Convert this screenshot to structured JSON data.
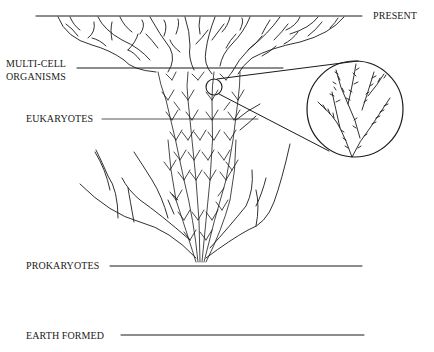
{
  "diagram": {
    "type": "tree-of-life timeline",
    "labels": {
      "present": "PRESENT",
      "multicell_line1": "MULTI-CELL",
      "multicell_line2": "ORGANISMS",
      "eukaryotes": "EUKARYOTES",
      "prokaryotes": "PROKARYOTES",
      "earth_formed": "EARTH FORMED"
    },
    "colors": {
      "ink": "#1a1a1a",
      "background": "#ffffff"
    },
    "inset": {
      "description": "magnified detail of branching lineages"
    }
  }
}
